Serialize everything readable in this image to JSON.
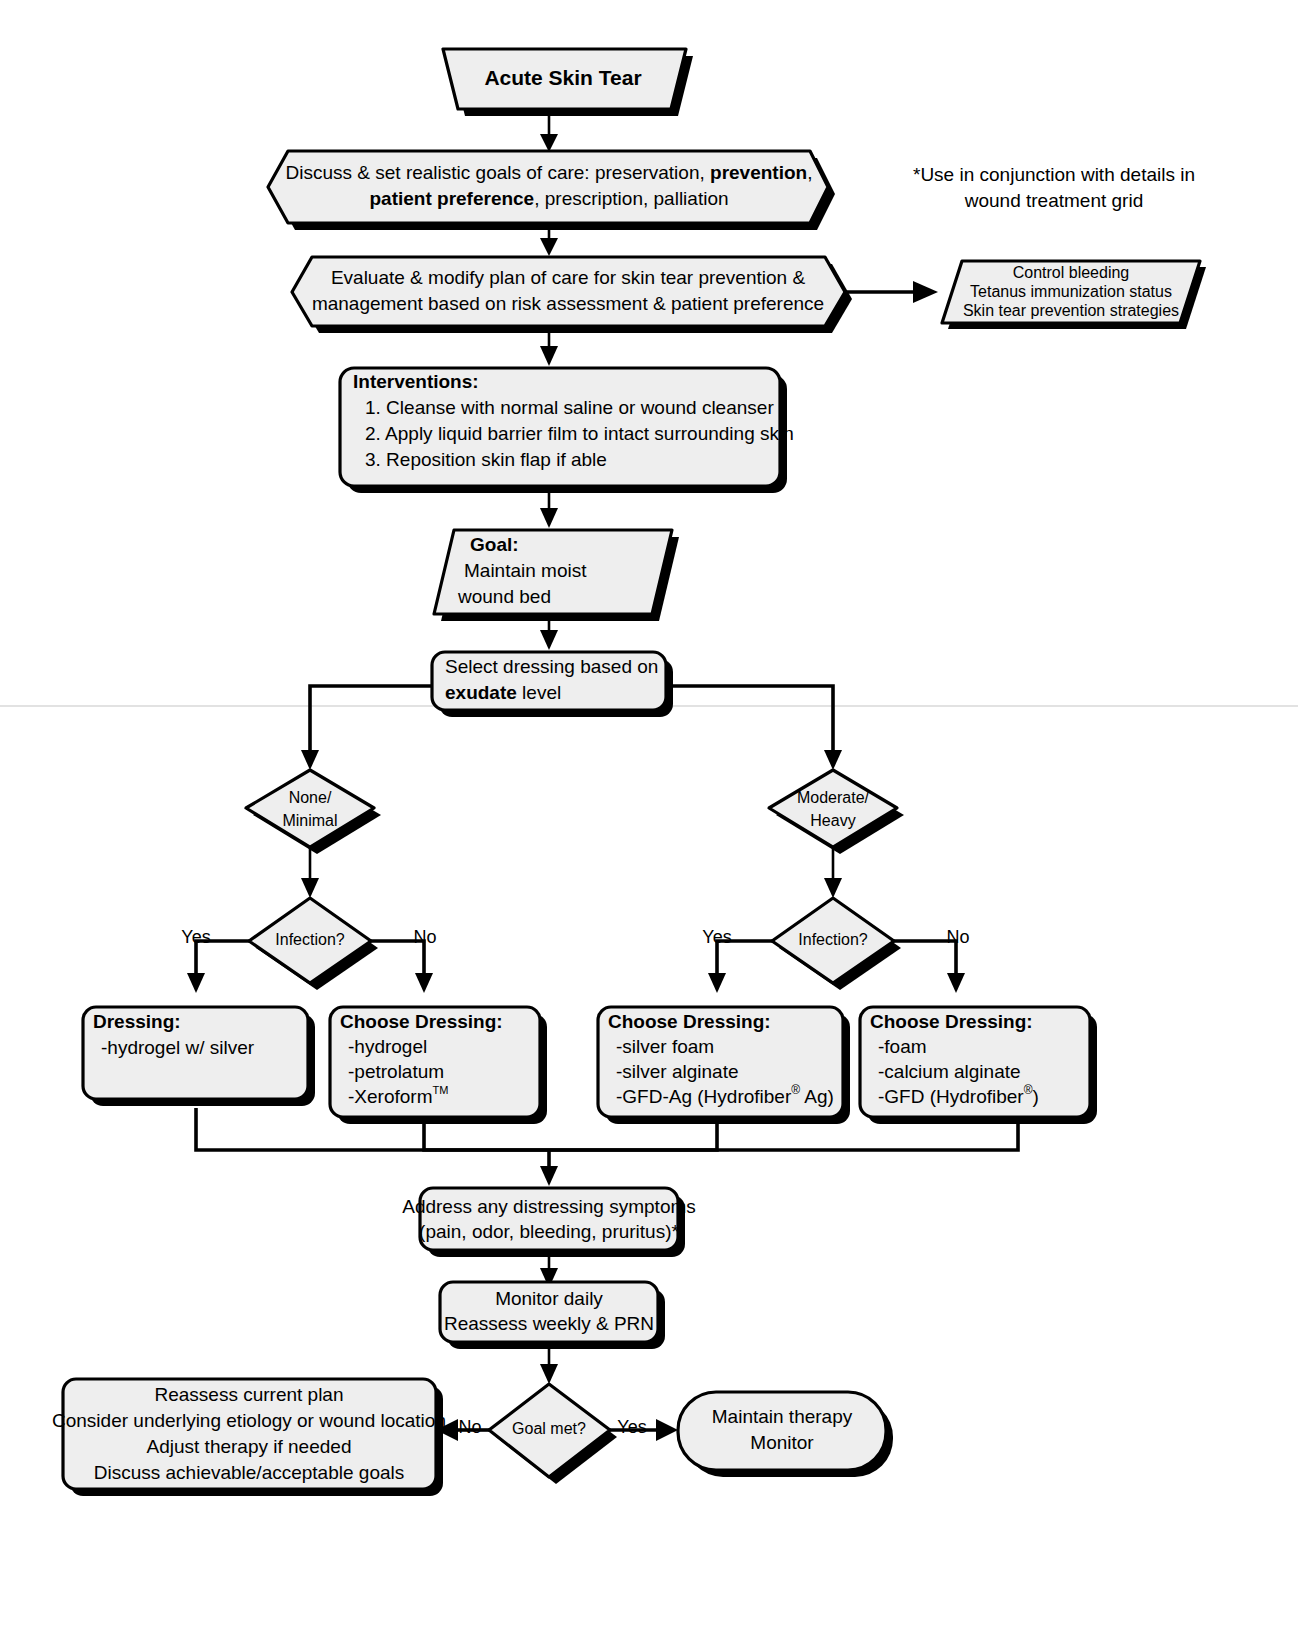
{
  "diagram": {
    "note": {
      "line1": "*Use in conjunction with details in",
      "line2": "wound treatment grid"
    },
    "colors": {
      "node_fill": "#EEEEEE",
      "stroke": "#000000",
      "background": "#FFFFFF",
      "shadow": "#000000"
    },
    "nodes": {
      "start": {
        "label": "Acute Skin Tear",
        "shape": "trapezoid"
      },
      "goals": {
        "shape": "hexagon",
        "line1_a": "Discuss & set realistic goals of care: preservation, ",
        "line1_b": "prevention",
        "line1_c": ",",
        "line2_a": "patient preference",
        "line2_b": ", prescription, palliation"
      },
      "evaluate": {
        "shape": "hexagon",
        "line1": "Evaluate & modify plan of care for skin tear prevention &",
        "line2": "management based on risk assessment & patient preference"
      },
      "side_considerations": {
        "shape": "parallelogram",
        "line1": "Control bleeding",
        "line2": "Tetanus immunization status",
        "line3": "Skin tear prevention strategies"
      },
      "interventions": {
        "shape": "rounded-rect",
        "heading": "Interventions:",
        "items": [
          "1. Cleanse with normal saline or wound cleanser",
          "2. Apply liquid barrier film to intact surrounding skin",
          "3. Reposition skin flap if able"
        ]
      },
      "goal": {
        "shape": "parallelogram",
        "heading": "Goal:",
        "line1": "Maintain moist",
        "line2": "wound bed"
      },
      "select_dressing": {
        "shape": "rounded-rect",
        "line1": "Select dressing based on",
        "line2_a": "exudate",
        "line2_b": " level"
      },
      "exudate_none": {
        "shape": "diamond",
        "line1": "None/",
        "line2": "Minimal"
      },
      "exudate_moderate": {
        "shape": "diamond",
        "line1": "Moderate/",
        "line2": "Heavy"
      },
      "infection_left": {
        "shape": "diamond",
        "label": "Infection?"
      },
      "infection_right": {
        "shape": "diamond",
        "label": "Infection?"
      },
      "dressing_left_yes": {
        "shape": "rounded-rect",
        "heading": "Dressing:",
        "items": [
          "-hydrogel w/ silver"
        ]
      },
      "dressing_left_no": {
        "shape": "rounded-rect",
        "heading": "Choose Dressing:",
        "items": [
          "-hydrogel",
          "-petrolatum",
          "-Xeroform"
        ],
        "item3_sup": "TM"
      },
      "dressing_right_yes": {
        "shape": "rounded-rect",
        "heading": "Choose Dressing:",
        "items": [
          "-silver foam",
          "-silver alginate"
        ],
        "item3_pre": "-GFD-Ag (Hydrofiber",
        "item3_sup": "®",
        "item3_post": " Ag)"
      },
      "dressing_right_no": {
        "shape": "rounded-rect",
        "heading": "Choose Dressing:",
        "items": [
          "-foam",
          "-calcium alginate"
        ],
        "item3_pre": "-GFD (Hydrofiber",
        "item3_sup": "®",
        "item3_post": ")"
      },
      "address_symptoms": {
        "shape": "rounded-rect",
        "line1": "Address any distressing symptoms",
        "line2": "(pain, odor, bleeding, pruritus)*"
      },
      "monitor": {
        "shape": "rounded-rect",
        "line1": "Monitor daily",
        "line2": "Reassess weekly & PRN"
      },
      "goal_met": {
        "shape": "diamond",
        "label": "Goal met?"
      },
      "reassess": {
        "shape": "rounded-rect",
        "line1": "Reassess current plan",
        "line2": "Consider underlying etiology or wound location",
        "line3": "Adjust therapy if needed",
        "line4": "Discuss achievable/acceptable goals"
      },
      "maintain": {
        "shape": "rounded-rect",
        "line1": "Maintain therapy",
        "line2": "Monitor"
      }
    },
    "edge_labels": {
      "left_yes": "Yes",
      "left_no": "No",
      "right_yes": "Yes",
      "right_no": "No",
      "goal_no": "No",
      "goal_yes": "Yes"
    }
  }
}
